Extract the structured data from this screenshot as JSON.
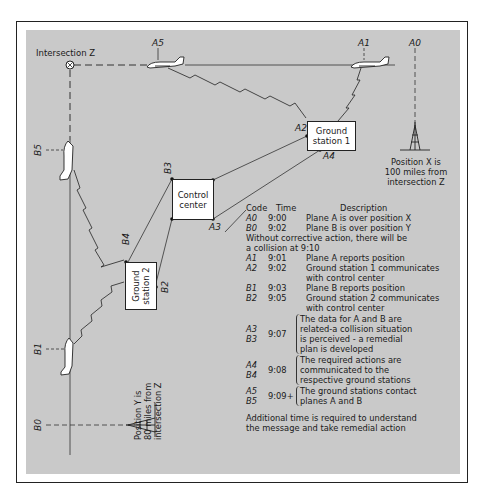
{
  "diagram": {
    "intersection_label": "Intersection Z",
    "markers": {
      "A5": "A5",
      "A1": "A1",
      "A0": "A0",
      "A2": "A2",
      "A3": "A3",
      "A4": "A4",
      "B5": "B5",
      "B4": "B4",
      "B3": "B3",
      "B2": "B2",
      "B1": "B1",
      "B0": "B0"
    },
    "nodes": {
      "ground_station_1": "Ground station 1",
      "ground_station_1_l1": "Ground",
      "ground_station_1_l2": "station 1",
      "control_center_l1": "Control",
      "control_center_l2": "center",
      "ground_station_2_l1": "Ground",
      "ground_station_2_l2": "station 2"
    },
    "position_x_note": [
      "Position X is",
      "100 miles from",
      "intersection Z"
    ],
    "position_y_note": [
      "Position Y is",
      "80 miles from",
      "intersection Z"
    ],
    "colors": {
      "panel": "#c9c9c9",
      "ink": "#1a1a1a",
      "box": "#ffffff",
      "border": "#222222"
    }
  },
  "table": {
    "headers": {
      "code": "Code",
      "time": "Time",
      "description": "Description"
    },
    "rows": [
      {
        "code": "A0",
        "time": "9:00",
        "description": "Plane A is over position X"
      },
      {
        "code": "B0",
        "time": "9:02",
        "description": "Plane B is over position Y"
      }
    ],
    "note1_l1": "Without corrective action, there will be",
    "note1_l2": "a collision at 9:10",
    "rows2": [
      {
        "code": "A1",
        "time": "9:01",
        "description": "Plane A reports position"
      },
      {
        "code": "A2",
        "time": "9:02",
        "description": "Ground station 1 communicates",
        "description2": "with control center"
      },
      {
        "code": "B1",
        "time": "9:03",
        "description": "Plane B reports position"
      },
      {
        "code": "B2",
        "time": "9:05",
        "description": "Ground station 2 communicates",
        "description2": "with control center"
      }
    ],
    "groups": [
      {
        "codes": [
          "A3",
          "B3"
        ],
        "time": "9:07",
        "lines": [
          "The data for A and B are",
          "related-a collision situation",
          "is perceived - a remedial",
          "plan is developed"
        ]
      },
      {
        "codes": [
          "A4",
          "B4"
        ],
        "time": "9:08",
        "lines": [
          "The required actions are",
          "communicated to the",
          "respective ground stations"
        ]
      },
      {
        "codes": [
          "A5",
          "B5"
        ],
        "time": "9:09+",
        "lines": [
          "The ground stations contact",
          "planes A and B"
        ]
      }
    ],
    "footer_l1": "Additional time is required to understand",
    "footer_l2": "the message and take remedial action"
  }
}
